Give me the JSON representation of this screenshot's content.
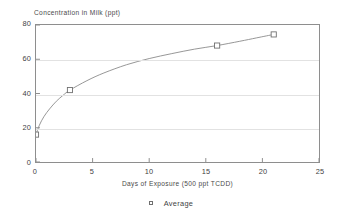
{
  "chart_data": {
    "type": "line",
    "title": "Concentration in Milk (ppt)",
    "xlabel": "Days of Exposure (500 ppt TCDD)",
    "ylabel": "Concentration in Milk (ppt)",
    "xlim": [
      0,
      25
    ],
    "ylim": [
      0,
      80
    ],
    "xticks": [
      "0",
      "5",
      "10",
      "15",
      "20",
      "25"
    ],
    "xtick_values": [
      0,
      5,
      10,
      15,
      20,
      25
    ],
    "yticks": [
      "0",
      "20",
      "40",
      "60",
      "80"
    ],
    "ytick_values": [
      0,
      20,
      40,
      60,
      80
    ],
    "grid": "horizontal",
    "legend_position": "bottom-center",
    "series": [
      {
        "name": "Average",
        "marker": "open-square",
        "marker_color": "#6f6f6f",
        "line_color": "#8a8a8a",
        "x": [
          0,
          3,
          16,
          21
        ],
        "values": [
          16,
          42,
          68,
          74.5
        ]
      }
    ],
    "curve_points": [
      {
        "x": 0,
        "y": 16
      },
      {
        "x": 0.3,
        "y": 21.5
      },
      {
        "x": 0.7,
        "y": 26.5
      },
      {
        "x": 1.2,
        "y": 31
      },
      {
        "x": 1.8,
        "y": 35.5
      },
      {
        "x": 2.4,
        "y": 39
      },
      {
        "x": 3,
        "y": 42
      },
      {
        "x": 4.5,
        "y": 47.5
      },
      {
        "x": 6,
        "y": 52
      },
      {
        "x": 8,
        "y": 56.8
      },
      {
        "x": 10,
        "y": 60.4
      },
      {
        "x": 12,
        "y": 63.3
      },
      {
        "x": 14,
        "y": 65.9
      },
      {
        "x": 16,
        "y": 68
      },
      {
        "x": 18,
        "y": 70.5
      },
      {
        "x": 19.5,
        "y": 72.5
      },
      {
        "x": 21,
        "y": 74.5
      }
    ],
    "annotations": []
  },
  "legend": {
    "entries": [
      {
        "label": "Average",
        "marker": "open-square-marker-icon"
      }
    ]
  }
}
